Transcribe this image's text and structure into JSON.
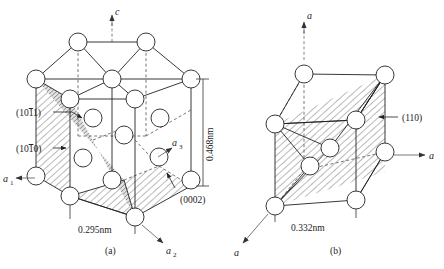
{
  "figure": {
    "background_color": "#ffffff",
    "line_color": "#222222",
    "atom_fill": "#ffffff"
  },
  "panel_a": {
    "caption": "(a)",
    "structure": "hexagonal close-packed unit cell",
    "axes": [
      {
        "name": "c-axis",
        "label": "c",
        "direction": "up",
        "style": "dashed"
      },
      {
        "name": "a1-axis",
        "label": "a",
        "subscript": "1",
        "direction": "left",
        "style": "solid"
      },
      {
        "name": "a2-axis",
        "label": "a",
        "subscript": "2",
        "direction": "down-right",
        "style": "solid"
      },
      {
        "name": "a3-axis",
        "label": "a",
        "subscript": "3",
        "direction": "up-right",
        "style": "solid"
      }
    ],
    "planes": [
      {
        "name": "pyramidal-plane",
        "label": "(1011)",
        "overbar_index": 2,
        "shading": "dark-hatch"
      },
      {
        "name": "prismatic-plane",
        "label": "(1010)",
        "overbar_index": 2,
        "shading": "light-hatch"
      },
      {
        "name": "basal-plane",
        "label": "(0002)",
        "overbar_index": null,
        "shading": "light-hatch"
      }
    ],
    "dimensions": [
      {
        "name": "a-parameter",
        "value": "0.295nm",
        "orientation": "horizontal",
        "position": "bottom"
      },
      {
        "name": "c-parameter",
        "value": "0.468nm",
        "orientation": "vertical",
        "position": "right"
      }
    ]
  },
  "panel_b": {
    "caption": "(b)",
    "structure": "body-centered cubic unit cell",
    "axes": [
      {
        "name": "a-axis-vertical",
        "label": "a",
        "direction": "up",
        "style": "dashed"
      },
      {
        "name": "a-axis-horizontal",
        "label": "a",
        "direction": "right",
        "style": "solid"
      },
      {
        "name": "a-axis-diagonal",
        "label": "a",
        "direction": "down-left",
        "style": "solid"
      }
    ],
    "planes": [
      {
        "name": "diagonal-plane",
        "label": "(110)",
        "overbar_index": null,
        "shading": "light-hatch"
      }
    ],
    "dimensions": [
      {
        "name": "a-parameter",
        "value": "0.332nm",
        "orientation": "horizontal",
        "position": "bottom"
      }
    ]
  }
}
